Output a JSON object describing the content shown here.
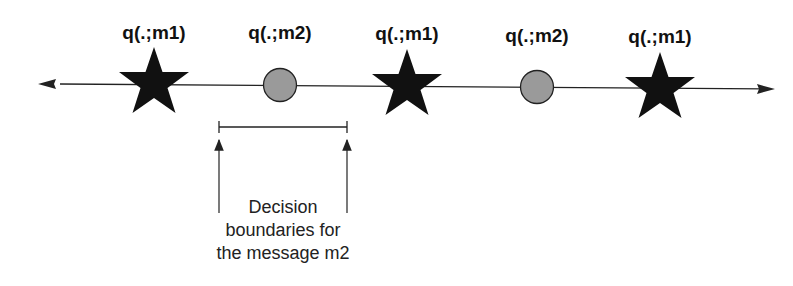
{
  "diagram": {
    "points": [
      {
        "label": "q(.;m1)",
        "shape": "star",
        "x": 154
      },
      {
        "label": "q(.;m2)",
        "shape": "circle",
        "x": 280
      },
      {
        "label": "q(.;m1)",
        "shape": "star",
        "x": 407
      },
      {
        "label": "q(.;m2)",
        "shape": "circle",
        "x": 537
      },
      {
        "label": "q(.;m1)",
        "shape": "star",
        "x": 660
      }
    ],
    "caption": {
      "line1": "Decision",
      "line2": "boundaries for",
      "line3": "the message m2"
    },
    "colors": {
      "star": "#111111",
      "circle": "#999999",
      "line": "#222222"
    }
  }
}
